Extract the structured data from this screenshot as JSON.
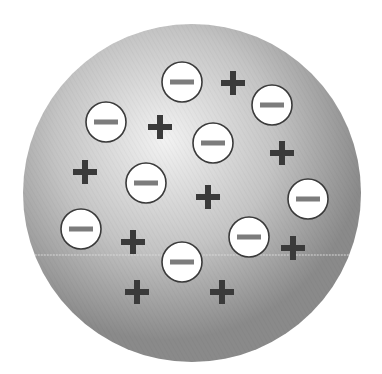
{
  "diagram": {
    "title": "",
    "kind": "plum-pudding-atom-model",
    "sphere": {
      "cx": 192,
      "cy": 193,
      "r": 169,
      "fill_center": "#f2f2f2",
      "fill_edge": "#8e8e8e",
      "highlight": {
        "cx": 165,
        "cy": 140
      }
    },
    "electron_style": {
      "r": 20,
      "fill": "#ffffff",
      "stroke": "#3a3a3a",
      "bar_color": "#7c7c7c",
      "bar_w": 24,
      "bar_h": 5
    },
    "proton_style": {
      "size": 24,
      "thickness": 6,
      "color": "#3a3a3a"
    },
    "electrons": [
      {
        "cx": 182,
        "cy": 82,
        "label": "−"
      },
      {
        "cx": 272,
        "cy": 105,
        "label": "−"
      },
      {
        "cx": 106,
        "cy": 122,
        "label": "−"
      },
      {
        "cx": 213,
        "cy": 143,
        "label": "−"
      },
      {
        "cx": 146,
        "cy": 183,
        "label": "−"
      },
      {
        "cx": 308,
        "cy": 199,
        "label": "−"
      },
      {
        "cx": 81,
        "cy": 229,
        "label": "−"
      },
      {
        "cx": 249,
        "cy": 237,
        "label": "−"
      },
      {
        "cx": 182,
        "cy": 262,
        "label": "−"
      }
    ],
    "protons": [
      {
        "cx": 233,
        "cy": 83,
        "label": "+"
      },
      {
        "cx": 160,
        "cy": 127,
        "label": "+"
      },
      {
        "cx": 282,
        "cy": 153,
        "label": "+"
      },
      {
        "cx": 85,
        "cy": 172,
        "label": "+"
      },
      {
        "cx": 208,
        "cy": 197,
        "label": "+"
      },
      {
        "cx": 133,
        "cy": 242,
        "label": "+"
      },
      {
        "cx": 293,
        "cy": 248,
        "label": "+"
      },
      {
        "cx": 137,
        "cy": 292,
        "label": "+"
      },
      {
        "cx": 222,
        "cy": 292,
        "label": "+"
      }
    ],
    "scan_line": {
      "y": 255,
      "color": "#d8d8d8"
    }
  }
}
